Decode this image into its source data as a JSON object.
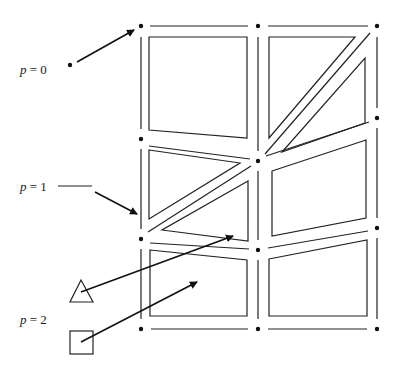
{
  "labels": [
    {
      "id": "p0",
      "var": "p",
      "eq": " = 0"
    },
    {
      "id": "p1",
      "var": "p",
      "eq": " = 1"
    },
    {
      "id": "p2",
      "var": "p",
      "eq": " = 2"
    }
  ],
  "legend_markers": [
    {
      "shape": "triangle",
      "meaning": "p = 2 interior node"
    },
    {
      "shape": "square",
      "meaning": "p = 2 interior node"
    }
  ],
  "mesh": {
    "description": "2x3 quadrilateral/triangular finite element mesh with vertices (p=0), edges (p=1) and cell interiors (p=2)",
    "vertex_count": 11,
    "cell_count": 9
  }
}
